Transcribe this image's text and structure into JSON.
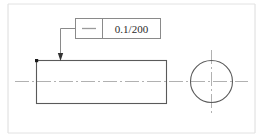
{
  "drawing": {
    "title": "Straightness tolerance per unit length callout",
    "type": "engineering-drawing",
    "width": 263,
    "height": 138,
    "background_color": "#ffffff",
    "border": {
      "color": "#d8d8d8",
      "left_x": 8,
      "right_x": 255,
      "top_y": 4,
      "bottom_y": 133
    },
    "line_colors": {
      "object_line": "#5a5a5a",
      "center_line": "#a8a8a8",
      "leader_line": "#7a7a7a",
      "frame_line": "#8a8a8a",
      "text": "#2b2b2b",
      "arrow": "#333333",
      "corner_dot": "#1a1a1a"
    },
    "feature_control_frame": {
      "name": "feature-control-frame",
      "symbol": "straightness-symbol",
      "symbol_glyph": "—",
      "tolerance_value": "0.1/200",
      "tolerance_magnitude": "0.1",
      "per_unit_length": "200",
      "x": 75,
      "y": 18,
      "width": 85,
      "height": 20,
      "divider_x": 102
    },
    "leader": {
      "name": "leader-line",
      "from_x": 75,
      "from_y": 28,
      "elbow_x": 60,
      "elbow_y": 28,
      "to_x": 60,
      "to_y": 60,
      "arrow_direction": "down"
    },
    "side_view": {
      "name": "shaft-side-view-rectangle",
      "x": 36,
      "y": 60,
      "width": 130,
      "height": 43,
      "corner_marker": {
        "x": 36,
        "y": 60
      }
    },
    "end_view": {
      "name": "shaft-end-view-circle",
      "center_x": 211,
      "center_y": 81,
      "radius": 21
    },
    "centerlines": {
      "horizontal": {
        "x1": 15,
        "x2": 248,
        "y": 81
      },
      "vertical": {
        "x": 211,
        "y1": 50,
        "y2": 113
      }
    }
  }
}
